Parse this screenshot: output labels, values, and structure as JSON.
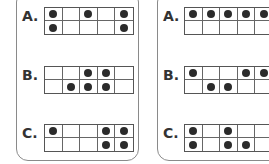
{
  "panels": [
    {
      "id": "left",
      "problems": [
        {
          "label": "A.",
          "grid": [
            [
              1,
              0,
              1,
              0,
              1
            ],
            [
              1,
              0,
              0,
              0,
              1
            ]
          ]
        },
        {
          "label": "B.",
          "grid": [
            [
              0,
              0,
              1,
              1,
              0
            ],
            [
              0,
              1,
              1,
              1,
              0
            ]
          ]
        },
        {
          "label": "C.",
          "grid": [
            [
              1,
              0,
              0,
              1,
              1
            ],
            [
              0,
              0,
              0,
              1,
              1
            ]
          ]
        }
      ]
    },
    {
      "id": "right",
      "problems": [
        {
          "label": "A.",
          "grid": [
            [
              1,
              1,
              1,
              1,
              1
            ],
            [
              0,
              0,
              0,
              0,
              0
            ]
          ]
        },
        {
          "label": "B.",
          "grid": [
            [
              1,
              0,
              0,
              1,
              1
            ],
            [
              0,
              1,
              1,
              0,
              0
            ]
          ]
        },
        {
          "label": "C.",
          "grid": [
            [
              1,
              0,
              1,
              0,
              0
            ],
            [
              1,
              0,
              1,
              1,
              0
            ]
          ]
        }
      ]
    }
  ]
}
